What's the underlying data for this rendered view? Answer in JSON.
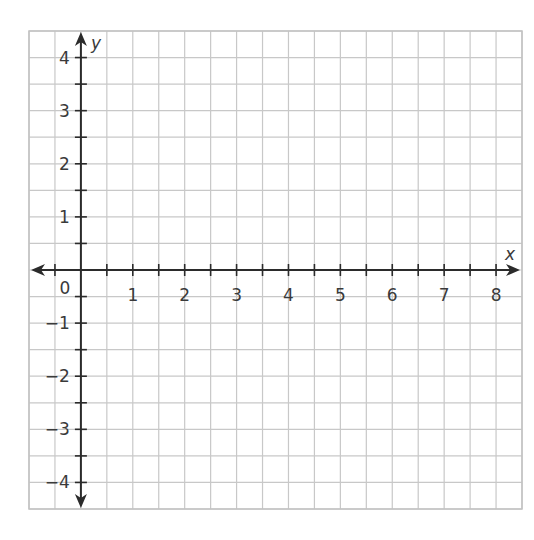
{
  "chart_data": {
    "type": "scatter",
    "title": "",
    "xlabel": "x",
    "ylabel": "y",
    "xlim": [
      -1,
      8.5
    ],
    "ylim": [
      -4.5,
      4.5
    ],
    "grid": true,
    "grid_spacing": 0.5,
    "x_ticks": [
      0.5,
      1,
      1.5,
      2,
      2.5,
      3,
      3.5,
      4,
      4.5,
      5,
      5.5,
      6,
      6.5,
      7,
      7.5,
      8,
      -0.5
    ],
    "x_tick_labels": [
      "1",
      "2",
      "3",
      "4",
      "5",
      "6",
      "7",
      "8"
    ],
    "y_tick_labels": [
      "4",
      "3",
      "2",
      "1",
      "−1",
      "−2",
      "−3",
      "−4"
    ],
    "origin_label": "0",
    "series": [],
    "legend": null
  },
  "colors": {
    "grid": "#c8c8c8",
    "axis": "#2b2b2b",
    "text": "#3a3a3a",
    "background": "#ffffff"
  }
}
